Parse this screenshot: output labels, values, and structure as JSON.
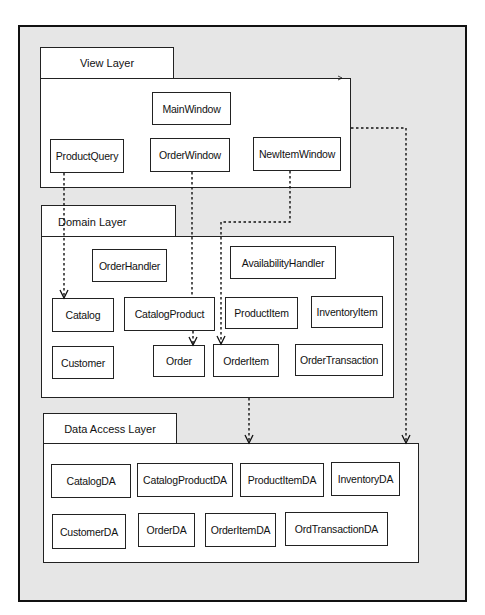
{
  "diagram": {
    "layers": {
      "view": {
        "label": "View Layer",
        "classes": {
          "main_window": "MainWindow",
          "product_query": "ProductQuery",
          "order_window": "OrderWindow",
          "new_item_window": "NewItemWindow"
        }
      },
      "domain": {
        "label": "Domain Layer",
        "classes": {
          "order_handler": "OrderHandler",
          "availability_handler": "AvailabilityHandler",
          "catalog": "Catalog",
          "catalog_product": "CatalogProduct",
          "product_item": "ProductItem",
          "inventory_item": "InventoryItem",
          "customer": "Customer",
          "order": "Order",
          "order_item": "OrderItem",
          "order_transaction": "OrderTransaction"
        }
      },
      "data_access": {
        "label": "Data Access Layer",
        "classes": {
          "catalog_da": "CatalogDA",
          "catalog_product_da": "CatalogProductDA",
          "product_item_da": "ProductItemDA",
          "inventory_da": "InventoryDA",
          "customer_da": "CustomerDA",
          "order_da": "OrderDA",
          "order_item_da": "OrderItemDA",
          "ord_transaction_da": "OrdTransactionDA"
        }
      }
    },
    "dependencies": [
      {
        "from": "ProductQuery",
        "to": "Catalog",
        "style": "dashed"
      },
      {
        "from": "OrderWindow",
        "to": "Order",
        "style": "dashed"
      },
      {
        "from": "NewItemWindow",
        "to": "OrderItem",
        "style": "dashed"
      },
      {
        "from": "View Layer",
        "to": "Data Access Layer",
        "style": "dashed"
      },
      {
        "from": "Domain Layer",
        "to": "Data Access Layer",
        "style": "dashed"
      }
    ],
    "colors": {
      "background": "#e6e6e6",
      "box_fill": "#ffffff",
      "line": "#111111"
    }
  }
}
